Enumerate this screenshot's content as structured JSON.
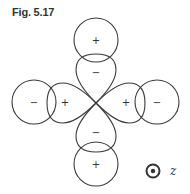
{
  "figure": {
    "label": "Fig. 5.17"
  },
  "diagram": {
    "lobes": [
      {
        "position": "top",
        "sign": "−"
      },
      {
        "position": "left",
        "sign": "+"
      },
      {
        "position": "right",
        "sign": "+"
      },
      {
        "position": "bottom",
        "sign": "−"
      }
    ],
    "outer_circles": [
      {
        "position": "top",
        "sign": "+"
      },
      {
        "position": "left",
        "sign": "−"
      },
      {
        "position": "right",
        "sign": "−"
      },
      {
        "position": "bottom",
        "sign": "+"
      }
    ],
    "axis": {
      "symbol": "⊙",
      "label": "z"
    },
    "stroke_color": "#3a3a3a"
  }
}
